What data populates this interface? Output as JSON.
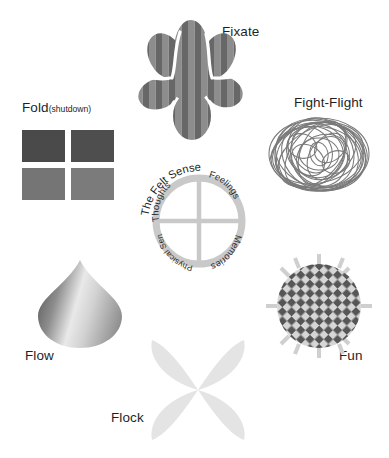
{
  "page": {
    "title": "The Felt Sense",
    "background_color": "#ffffff",
    "width": 389,
    "height": 458
  },
  "nodes": {
    "fold": {
      "label": "Fold",
      "sub_label": "(shutdown)",
      "icon": "four-squares-grid-icon",
      "squares": [
        {
          "name": "top-left",
          "color": "#4a4a4a"
        },
        {
          "name": "top-right",
          "color": "#4e4e4e"
        },
        {
          "name": "bottom-left",
          "color": "#757575"
        },
        {
          "name": "bottom-right",
          "color": "#7b7b7b"
        }
      ]
    },
    "fixate": {
      "label": "Fixate",
      "icon": "striped-flower-blob-icon",
      "stripe_colors": [
        "#8d8d8d",
        "#6a6a6a"
      ],
      "petal_count": 7
    },
    "fight_flight": {
      "label": "Fight-Flight",
      "icon": "tangled-scribble-ball-icon",
      "stroke_color": "#6f6f6f"
    },
    "felt_sense": {
      "title": "The Felt Sense",
      "icon": "quadrant-ring-icon",
      "ring_color": "#c9c9c9",
      "quadrants": [
        {
          "name": "thoughts",
          "label": "Thoughts"
        },
        {
          "name": "feelings",
          "label": "Feelings"
        },
        {
          "name": "memories",
          "label": "Memories"
        },
        {
          "name": "physical-sensations",
          "label": "Physical Sensations"
        }
      ]
    },
    "flow": {
      "label": "Flow",
      "icon": "teardrop-gradient-icon",
      "gradient": [
        "#6f6f6f",
        "#e8e8e8",
        "#9a9a9a"
      ]
    },
    "fun": {
      "label": "Fun",
      "icon": "checkerboard-sun-circle-icon",
      "check_colors": [
        "#565656",
        "#d6d6d6"
      ],
      "ray_color": "#cfcfcf",
      "ray_count": 12
    },
    "flock": {
      "label": "Flock",
      "icon": "four-petal-flower-icon",
      "color": "#e4e4e4"
    }
  }
}
